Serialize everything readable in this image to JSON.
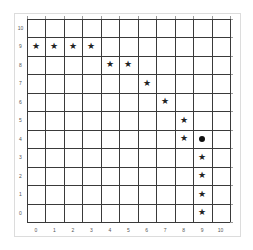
{
  "grid": {
    "cols": 11,
    "rows": 11,
    "x_labels": [
      "0",
      "1",
      "2",
      "3",
      "4",
      "5",
      "6",
      "7",
      "8",
      "9",
      "10"
    ],
    "y_labels": [
      "10",
      "9",
      "8",
      "7",
      "6",
      "5",
      "4",
      "3",
      "2",
      "1",
      "0"
    ],
    "line_color": "#3a3a3a",
    "background": "#ffffff"
  },
  "path_markers": {
    "symbol": "★",
    "points": [
      {
        "x": 0,
        "y": 9
      },
      {
        "x": 1,
        "y": 9
      },
      {
        "x": 2,
        "y": 9
      },
      {
        "x": 3,
        "y": 9
      },
      {
        "x": 4,
        "y": 8
      },
      {
        "x": 5,
        "y": 8
      },
      {
        "x": 6,
        "y": 7
      },
      {
        "x": 7,
        "y": 6
      },
      {
        "x": 8,
        "y": 5
      },
      {
        "x": 8,
        "y": 4
      },
      {
        "x": 9,
        "y": 3
      },
      {
        "x": 9,
        "y": 2
      },
      {
        "x": 9,
        "y": 1
      },
      {
        "x": 9,
        "y": 0
      }
    ]
  },
  "agent": {
    "x": 9,
    "y": 4,
    "shape": "filled-circle",
    "color": "#111111"
  }
}
